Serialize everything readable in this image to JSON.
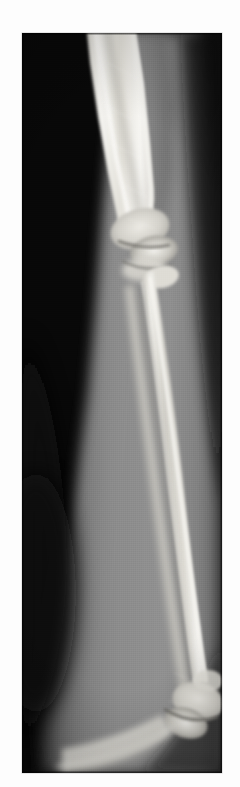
{
  "page": {
    "background_color": "#fdfdfd",
    "width": 240,
    "height": 787
  },
  "radiograph": {
    "name": "forearm-radiograph",
    "modality": "X-ray",
    "view": "lateral / oblique",
    "body_region": "forearm and elbow",
    "orientation": "proximal at top, distal at bottom",
    "film_background_color": "#070707",
    "bone_color": "#e8e6e0",
    "soft_tissue_color": "#8b8b8b",
    "frame": {
      "x": 22,
      "y": 33,
      "width": 200,
      "height": 740
    },
    "anatomy": [
      {
        "label": "humeral shaft",
        "region": "upper-left",
        "brightness": "bright"
      },
      {
        "label": "elbow joint",
        "region": "upper-middle",
        "brightness": "bright"
      },
      {
        "label": "olecranon",
        "region": "upper-middle-right",
        "brightness": "bright"
      },
      {
        "label": "radius shaft",
        "region": "mid-right",
        "brightness": "bright"
      },
      {
        "label": "ulna shaft",
        "region": "mid-center",
        "brightness": "medium"
      },
      {
        "label": "soft tissue envelope",
        "region": "left and center",
        "brightness": "medium-gray"
      },
      {
        "label": "distal joint",
        "region": "lower-right",
        "brightness": "bright"
      },
      {
        "label": "air background",
        "region": "upper-right and lower-right corner",
        "brightness": "black"
      }
    ]
  }
}
